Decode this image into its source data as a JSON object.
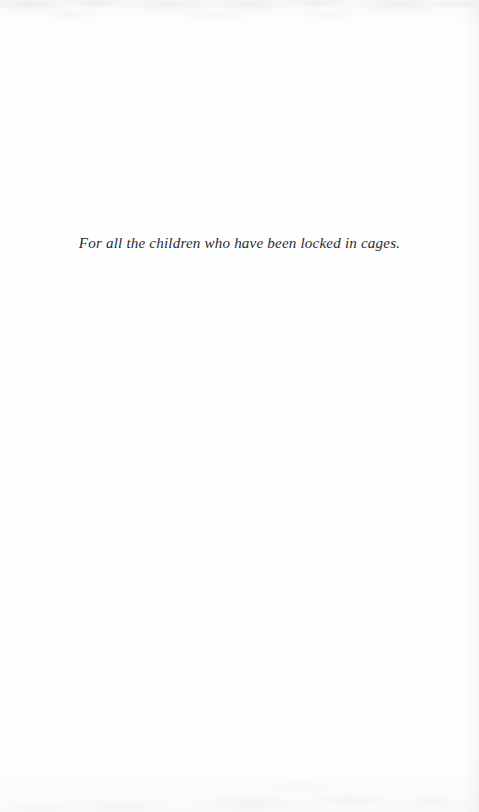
{
  "document": {
    "page_type": "dedication",
    "page_background_color": "#fefefe",
    "text_color": "#2b2b2e"
  },
  "dedication": {
    "line": "For all the children who have been locked in cages."
  },
  "artifacts": {
    "top_band_label": "scan-shadow-top",
    "right_edge_label": "scan-shadow-right",
    "bottom_band_label": "scan-shadow-bottom",
    "specks_label": "scan-dust-specks"
  }
}
